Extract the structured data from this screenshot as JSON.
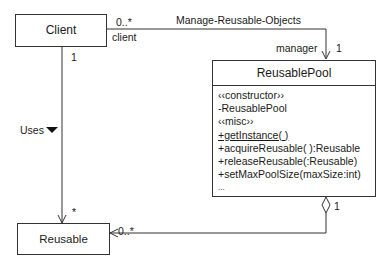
{
  "classes": {
    "client": {
      "name": "Client"
    },
    "reusable": {
      "name": "Reusable"
    },
    "reusable_pool": {
      "name": "ReusablePool",
      "members": [
        {
          "text": "‹‹constructor››",
          "underline": false
        },
        {
          "text": "-ReusablePool",
          "underline": false
        },
        {
          "text": "‹‹misc››",
          "underline": false
        },
        {
          "text": "+getInstance( )",
          "underline": true
        },
        {
          "text": "+acquireReusable( ):Reusable",
          "underline": false
        },
        {
          "text": "+releaseReusable(:Reusable)",
          "underline": false
        },
        {
          "text": "+setMaxPoolSize(maxSize:int)",
          "underline": false
        },
        {
          "text": "...",
          "underline": false
        }
      ]
    }
  },
  "associations": {
    "manage": {
      "name": "Manage-Reusable-Objects",
      "client_multiplicity": "0..*",
      "client_role": "client",
      "pool_role": "manager",
      "pool_multiplicity": "1"
    },
    "uses": {
      "name": "Uses",
      "direction_icon": "filled-triangle-down",
      "client_multiplicity": "1",
      "reusable_multiplicity": "*"
    },
    "aggregation": {
      "pool_multiplicity": "1",
      "reusable_multiplicity": "0..*"
    }
  }
}
